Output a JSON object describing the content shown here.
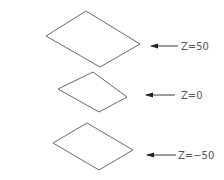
{
  "diagram": {
    "type": "stacked-planes",
    "colors": {
      "outline": "#6a6a6a",
      "arrow": "#3a3a3a",
      "label": "#555555",
      "background": "#ffffff"
    },
    "planes": [
      {
        "id": "z50",
        "label": "Z=50",
        "points": "86,11 140,44 100,67 46,36"
      },
      {
        "id": "z0",
        "label": "Z=0",
        "points": "93,72 127,97 99,112 58,89"
      },
      {
        "id": "zm50",
        "label": "Z=−50",
        "points": "87,123 133,150 99,170 53,143"
      }
    ],
    "arrows": [
      {
        "points_to": "z50",
        "x1": 151,
        "x2": 178,
        "y": 46,
        "label_x": 181,
        "label_y": 50
      },
      {
        "points_to": "z0",
        "x1": 146,
        "x2": 175,
        "y": 95,
        "label_x": 181,
        "label_y": 99
      },
      {
        "points_to": "zm50",
        "x1": 147,
        "x2": 176,
        "y": 155,
        "label_x": 178,
        "label_y": 159
      }
    ]
  }
}
